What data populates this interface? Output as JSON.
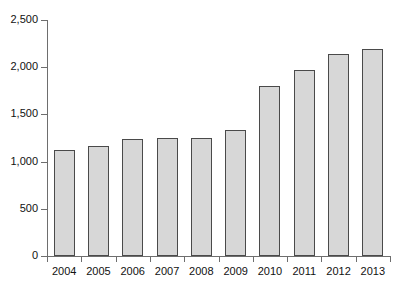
{
  "chart_data": {
    "type": "bar",
    "title": "",
    "subtitle": "",
    "xlabel": "",
    "ylabel": "",
    "categories": [
      "2004",
      "2005",
      "2006",
      "2007",
      "2008",
      "2009",
      "2010",
      "2011",
      "2012",
      "2013"
    ],
    "values": [
      1120,
      1165,
      1235,
      1250,
      1250,
      1340,
      1800,
      1975,
      2140,
      2195
    ],
    "series": [
      {
        "name": "",
        "values": [
          1120,
          1165,
          1235,
          1250,
          1250,
          1340,
          1800,
          1975,
          2140,
          2195
        ]
      }
    ],
    "ylim": [
      0,
      2500
    ],
    "ytick_values": [
      0,
      500,
      1000,
      1500,
      2000,
      2500
    ],
    "ytick_labels": [
      "0",
      "500",
      "1,000",
      "1,500",
      "2,000",
      "2,500"
    ],
    "grid": false,
    "legend": false,
    "legend_position": "none",
    "annotations": [],
    "bar_fill_color": "#d7d7d7",
    "bar_border_color": "#4a4a4a",
    "axis_color": "#6e6e6e",
    "background_color": "#ffffff"
  }
}
